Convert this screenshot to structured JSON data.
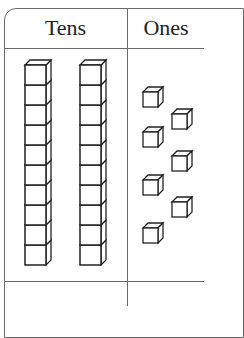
{
  "table": {
    "columns": [
      {
        "label": "Tens"
      },
      {
        "label": "Ones"
      }
    ]
  },
  "blocks": {
    "tens_rods": 2,
    "cubes_per_rod": 10,
    "ones_units": 7
  },
  "colors": {
    "line": "#222222",
    "border": "#6a6a6a",
    "fill": "#ffffff"
  }
}
